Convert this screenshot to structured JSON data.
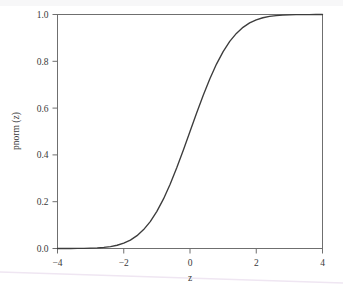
{
  "chart_data": {
    "type": "line",
    "title": "",
    "subtitle": "",
    "xlabel": "z",
    "ylabel": "pnorm (z)",
    "xlim": [
      -4,
      4
    ],
    "ylim": [
      0.0,
      1.0
    ],
    "grid": false,
    "legend": false,
    "legend_position": "none",
    "frame": "box",
    "tick_direction": "outward",
    "line_color": "#3c3c3c",
    "axis_color": "#6f6f6f",
    "background_color": "#ffffff",
    "xticks": [
      "-4",
      "-2",
      "0",
      "2",
      "4"
    ],
    "xtick_values": [
      -4,
      -2,
      0,
      2,
      4
    ],
    "yticks": [
      "0.0",
      "0.2",
      "0.4",
      "0.6",
      "0.8",
      "1.0"
    ],
    "ytick_values": [
      0.0,
      0.2,
      0.4,
      0.6,
      0.8,
      1.0
    ],
    "series": [
      {
        "name": "pnorm(z)",
        "x": [
          -4.0,
          -3.8,
          -3.6,
          -3.4,
          -3.2,
          -3.0,
          -2.8,
          -2.6,
          -2.4,
          -2.2,
          -2.0,
          -1.8,
          -1.6,
          -1.4,
          -1.2,
          -1.0,
          -0.8,
          -0.6,
          -0.4,
          -0.2,
          0.0,
          0.2,
          0.4,
          0.6,
          0.8,
          1.0,
          1.2,
          1.4,
          1.6,
          1.8,
          2.0,
          2.2,
          2.4,
          2.6,
          2.8,
          3.0,
          3.2,
          3.4,
          3.6,
          3.8,
          4.0
        ],
        "values": [
          3e-05,
          7e-05,
          0.00016,
          0.00034,
          0.00069,
          0.00135,
          0.00256,
          0.00466,
          0.0082,
          0.0139,
          0.0228,
          0.0359,
          0.0548,
          0.0808,
          0.1151,
          0.1587,
          0.2119,
          0.2743,
          0.3446,
          0.4207,
          0.5,
          0.5793,
          0.6554,
          0.7257,
          0.7881,
          0.8413,
          0.8849,
          0.9192,
          0.9452,
          0.9641,
          0.9772,
          0.9861,
          0.9918,
          0.9953,
          0.9974,
          0.9987,
          0.9993,
          0.9997,
          0.9998,
          0.9999,
          1.0
        ]
      }
    ]
  },
  "figure": {
    "xaxis_label": "z",
    "yaxis_label": "pnorm (z)"
  }
}
